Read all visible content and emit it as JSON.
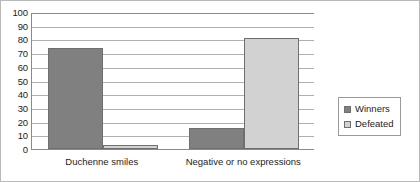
{
  "chart_data": {
    "type": "bar",
    "title": "",
    "xlabel": "",
    "ylabel": "",
    "ylim": [
      0,
      100
    ],
    "ytick_step": 10,
    "yticks": [
      100,
      90,
      80,
      70,
      60,
      50,
      40,
      30,
      20,
      10,
      0
    ],
    "grid": true,
    "legend_position": "right",
    "categories": [
      "Duchenne smiles",
      "Negative or no expressions"
    ],
    "series": [
      {
        "name": "Winners",
        "color": "#808080",
        "values": [
          74,
          15
        ]
      },
      {
        "name": "Defeated",
        "color": "#d2d2d2",
        "values": [
          3,
          81
        ]
      }
    ]
  },
  "legend": {
    "entries": [
      {
        "label": "Winners"
      },
      {
        "label": "Defeated"
      }
    ]
  },
  "colors": {
    "winners": "#808080",
    "defeated": "#d2d2d2",
    "axis": "#8a8a8a",
    "gridline": "#b0b0b0",
    "border": "#b9b9b9",
    "text": "#1c1c1c"
  }
}
